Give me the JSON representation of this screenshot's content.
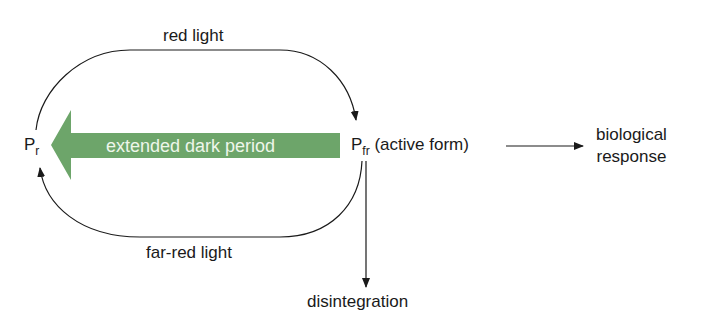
{
  "diagram": {
    "colors": {
      "arrow_green": "#6da56a",
      "line": "#1a1a1a",
      "green_text": "#eef6ea"
    },
    "nodes": {
      "pr": {
        "main": "P",
        "sub": "r"
      },
      "pfr": {
        "main": "P",
        "sub": "fr",
        "suffix": " (active form)"
      },
      "response": {
        "line1": "biological",
        "line2": "response"
      },
      "disintegration": {
        "label": "disintegration"
      }
    },
    "edges": {
      "top": {
        "label": "red light",
        "from": "pr",
        "to": "pfr"
      },
      "bottom": {
        "label": "far-red light",
        "from": "pfr",
        "to": "pr"
      },
      "middle": {
        "label": "extended dark period",
        "from": "pfr",
        "to": "pr"
      },
      "right": {
        "from": "pfr",
        "to": "response"
      },
      "down": {
        "from": "pfr",
        "to": "disintegration"
      }
    }
  }
}
